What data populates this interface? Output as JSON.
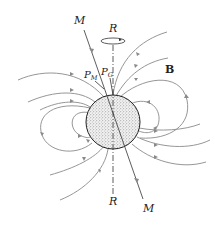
{
  "diagram": {
    "labels": {
      "magnetic_axis_top": "M",
      "magnetic_axis_bottom": "M",
      "rotation_axis_top": "R",
      "rotation_axis_bottom": "R",
      "magnetic_pole": "P",
      "magnetic_pole_sub": "M",
      "geographic_pole": "P",
      "geographic_pole_sub": "G",
      "field": "B"
    },
    "colors": {
      "field_lines": "#8a8a8a",
      "axes": "#333333",
      "globe_fill": "#e6e6e6",
      "text": "#222222"
    },
    "globe": {
      "cx": 113,
      "cy": 122,
      "r": 27
    }
  }
}
